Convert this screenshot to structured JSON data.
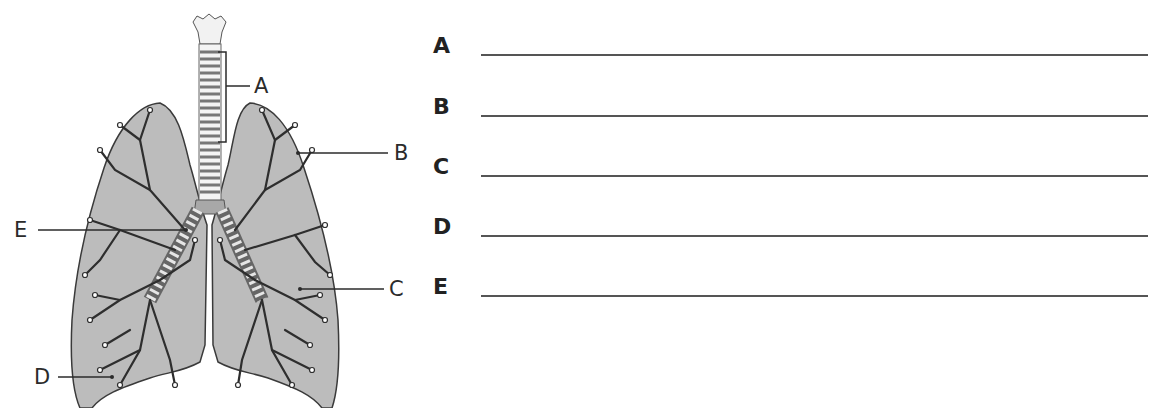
{
  "figure": {
    "callouts": [
      {
        "letter": "A",
        "points_to": "trachea"
      },
      {
        "letter": "B",
        "points_to": "lung"
      },
      {
        "letter": "C",
        "points_to": "bronchiole"
      },
      {
        "letter": "D",
        "points_to": "alveoli"
      },
      {
        "letter": "E",
        "points_to": "bronchus"
      }
    ],
    "colors": {
      "lung_fill": "#b8b8b8",
      "lung_outline": "#3a3a3a",
      "branch": "#2e2e2e",
      "trachea_ring": "#8a8a8a"
    }
  },
  "answers": {
    "rows": [
      {
        "letter": "A",
        "value": ""
      },
      {
        "letter": "B",
        "value": ""
      },
      {
        "letter": "C",
        "value": ""
      },
      {
        "letter": "D",
        "value": ""
      },
      {
        "letter": "E",
        "value": ""
      }
    ]
  }
}
